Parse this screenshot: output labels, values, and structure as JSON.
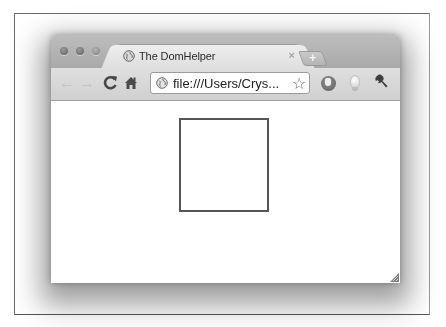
{
  "window": {
    "traffic_lights": [
      "close",
      "minimize",
      "zoom"
    ]
  },
  "tabs": [
    {
      "title": "The DomHelper",
      "favicon": "globe-icon",
      "close_glyph": "×",
      "active": true
    }
  ],
  "new_tab": {
    "glyph": "+"
  },
  "toolbar": {
    "back_glyph": "←",
    "forward_glyph": "→",
    "reload_glyph": "C",
    "home_icon": "home-icon",
    "address": "file:///Users/Crys...",
    "bookmark_glyph": "☆",
    "extensions": [
      "hand-extension-icon",
      "lightbulb-extension-icon"
    ],
    "menu_icon": "wrench-icon"
  },
  "page": {
    "elements": [
      {
        "type": "box",
        "description": "square outline"
      }
    ]
  },
  "colors": {
    "titlebar": "#b3b3b3",
    "tab": "#e6e6e6",
    "toolbar": "#d8d8d8",
    "square_border": "#555555"
  }
}
